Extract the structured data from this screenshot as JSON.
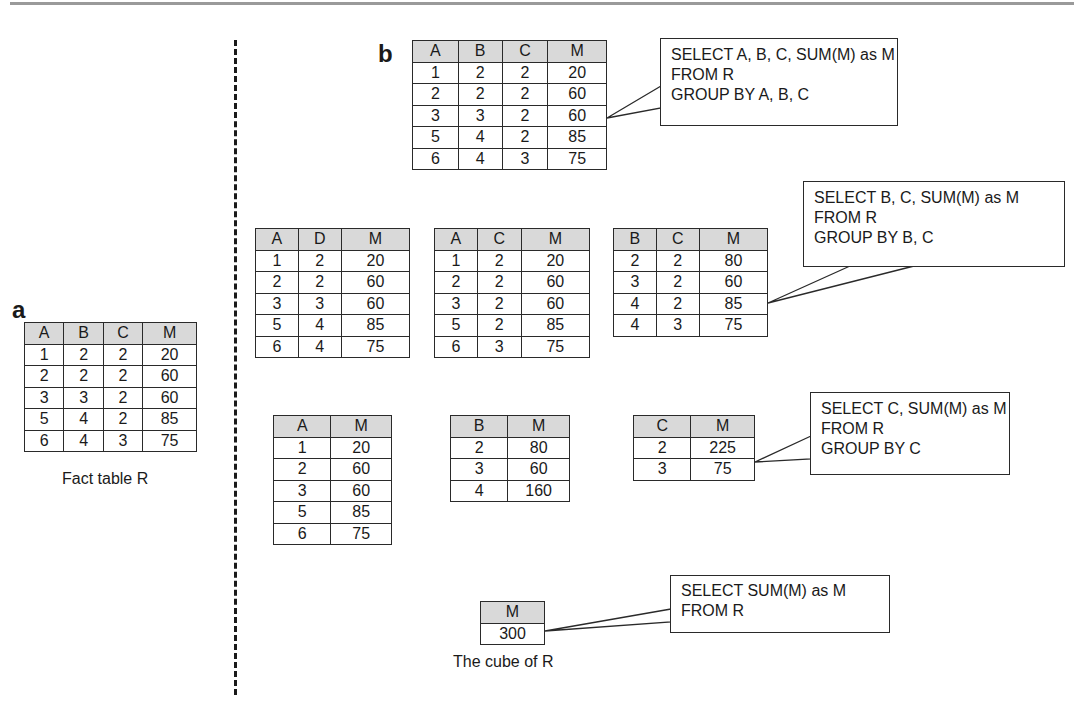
{
  "panels": {
    "a": {
      "label": "a",
      "caption": "Fact table R",
      "table": {
        "headers": [
          "A",
          "B",
          "C",
          "M"
        ],
        "rows": [
          [
            "1",
            "2",
            "2",
            "20"
          ],
          [
            "2",
            "2",
            "2",
            "60"
          ],
          [
            "3",
            "3",
            "2",
            "60"
          ],
          [
            "5",
            "4",
            "2",
            "85"
          ],
          [
            "6",
            "4",
            "3",
            "75"
          ]
        ]
      }
    },
    "b": {
      "label": "b",
      "caption": "The cube of R",
      "tables": {
        "abc": {
          "headers": [
            "A",
            "B",
            "C",
            "M"
          ],
          "rows": [
            [
              "1",
              "2",
              "2",
              "20"
            ],
            [
              "2",
              "2",
              "2",
              "60"
            ],
            [
              "3",
              "3",
              "2",
              "60"
            ],
            [
              "5",
              "4",
              "2",
              "85"
            ],
            [
              "6",
              "4",
              "3",
              "75"
            ]
          ]
        },
        "ad": {
          "headers": [
            "A",
            "D",
            "M"
          ],
          "rows": [
            [
              "1",
              "2",
              "20"
            ],
            [
              "2",
              "2",
              "60"
            ],
            [
              "3",
              "3",
              "60"
            ],
            [
              "5",
              "4",
              "85"
            ],
            [
              "6",
              "4",
              "75"
            ]
          ]
        },
        "ac": {
          "headers": [
            "A",
            "C",
            "M"
          ],
          "rows": [
            [
              "1",
              "2",
              "20"
            ],
            [
              "2",
              "2",
              "60"
            ],
            [
              "3",
              "2",
              "60"
            ],
            [
              "5",
              "2",
              "85"
            ],
            [
              "6",
              "3",
              "75"
            ]
          ]
        },
        "bc": {
          "headers": [
            "B",
            "C",
            "M"
          ],
          "rows": [
            [
              "2",
              "2",
              "80"
            ],
            [
              "3",
              "2",
              "60"
            ],
            [
              "4",
              "2",
              "85"
            ],
            [
              "4",
              "3",
              "75"
            ]
          ]
        },
        "a": {
          "headers": [
            "A",
            "M"
          ],
          "rows": [
            [
              "1",
              "20"
            ],
            [
              "2",
              "60"
            ],
            [
              "3",
              "60"
            ],
            [
              "5",
              "85"
            ],
            [
              "6",
              "75"
            ]
          ]
        },
        "b": {
          "headers": [
            "B",
            "M"
          ],
          "rows": [
            [
              "2",
              "80"
            ],
            [
              "3",
              "60"
            ],
            [
              "4",
              "160"
            ]
          ]
        },
        "c": {
          "headers": [
            "C",
            "M"
          ],
          "rows": [
            [
              "2",
              "225"
            ],
            [
              "3",
              "75"
            ]
          ]
        },
        "total": {
          "headers": [
            "M"
          ],
          "rows": [
            [
              "300"
            ]
          ]
        }
      },
      "callouts": {
        "abc": [
          "SELECT A, B, C, SUM(M) as M",
          "FROM R",
          "GROUP BY A, B, C"
        ],
        "bc": [
          "SELECT B, C, SUM(M) as M",
          "FROM R",
          "GROUP BY B, C"
        ],
        "c": [
          "SELECT C, SUM(M) as M",
          "FROM R",
          "GROUP BY C"
        ],
        "total": [
          "SELECT SUM(M) as M",
          "FROM R"
        ]
      }
    }
  },
  "colors": {
    "header_fill": "#d9d9d9",
    "border": "#2a2a2a",
    "divider": "#1a1a1a"
  }
}
